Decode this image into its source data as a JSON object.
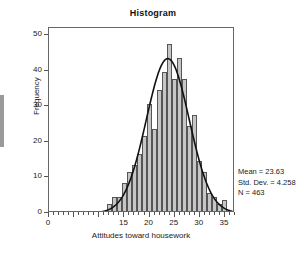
{
  "chart_data": {
    "type": "bar",
    "title": "Histogram",
    "xlabel": "Attitudes toward housework",
    "ylabel": "Frequency",
    "xlim": [
      0,
      37
    ],
    "ylim": [
      0,
      52
    ],
    "grid": false,
    "bin_width": 1,
    "categories": [
      12,
      13,
      14,
      15,
      16,
      17,
      18,
      19,
      20,
      21,
      22,
      23,
      24,
      25,
      26,
      27,
      28,
      29,
      30,
      31,
      32,
      33,
      34,
      35
    ],
    "values": [
      2,
      4,
      4,
      8,
      11,
      13,
      16,
      21,
      30,
      23,
      34,
      39,
      47,
      37,
      43,
      37,
      24,
      27,
      14,
      11,
      5,
      4,
      2,
      3
    ],
    "x_ticks": [
      0,
      5,
      10,
      15,
      20,
      25,
      30,
      35
    ],
    "x_tick_labels": [
      "0",
      "",
      "",
      "15",
      "20",
      "25",
      "30",
      "35"
    ],
    "y_ticks": [
      0,
      10,
      20,
      30,
      40,
      50
    ],
    "y_tick_labels": [
      "0",
      "10",
      "20",
      "30",
      "40",
      "50"
    ],
    "overlay": {
      "name": "normal-curve",
      "mean": 23.63,
      "std_dev": 4.258,
      "n": 463,
      "peak_value": 43.4
    },
    "bar_fill": "#c6c6c6",
    "bar_edge": "#555555",
    "curve_color": "#111111"
  },
  "annotations": {
    "mean_label": "Mean = 23.63",
    "std_dev_label": "Std. Dev. = 4.258",
    "n_label": "N = 463"
  }
}
